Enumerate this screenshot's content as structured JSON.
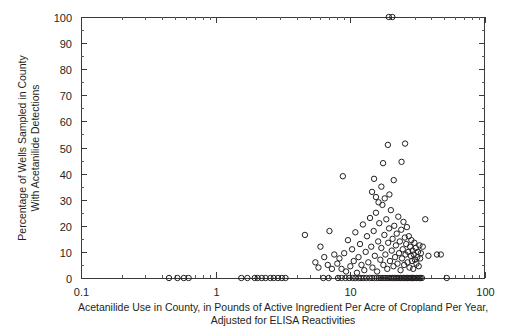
{
  "chart_data": {
    "type": "scatter",
    "title": "",
    "xlabel": "Acetanilide Use in County, in Pounds of Active Ingredient Per Acre of Cropland Per Year, Adjusted for ELISA Reactivities",
    "xlabel_line1": "Acetanilide Use in County, in Pounds of Active Ingredient Per Acre of Cropland Per Year,",
    "xlabel_line2": "Adjusted for ELISA Reactivities",
    "ylabel": "Percentage of Wells Sampled in County With Acetanilide Detections",
    "ylabel_line1": "Percentage of Wells Sampled in County",
    "ylabel_line2": "With Acetanilide Detections",
    "xscale": "log",
    "yscale": "linear",
    "xlim": [
      0.1,
      100
    ],
    "ylim": [
      0,
      100
    ],
    "grid": false,
    "legend": false,
    "marker_style": "open-circle",
    "marker_color": "#231f20",
    "xticks": [
      "0.1",
      "1",
      "10",
      "100"
    ],
    "xtick_values": [
      0.1,
      1,
      10,
      100
    ],
    "yticks": [
      "0",
      "10",
      "20",
      "30",
      "40",
      "50",
      "60",
      "70",
      "80",
      "90",
      "100"
    ],
    "ytick_values": [
      0,
      10,
      20,
      30,
      40,
      50,
      60,
      70,
      80,
      90,
      100
    ],
    "points": [
      [
        0.45,
        0
      ],
      [
        0.52,
        0
      ],
      [
        0.58,
        0
      ],
      [
        0.63,
        0
      ],
      [
        1.55,
        0
      ],
      [
        1.72,
        0
      ],
      [
        1.95,
        0
      ],
      [
        2.05,
        0
      ],
      [
        2.2,
        0
      ],
      [
        2.35,
        0
      ],
      [
        2.55,
        0
      ],
      [
        2.7,
        0
      ],
      [
        2.9,
        0
      ],
      [
        3.1,
        0
      ],
      [
        3.3,
        0
      ],
      [
        6.3,
        0
      ],
      [
        6.9,
        0
      ],
      [
        8.1,
        0
      ],
      [
        8.6,
        0
      ],
      [
        9.2,
        0
      ],
      [
        9.8,
        0
      ],
      [
        10.4,
        0
      ],
      [
        10.9,
        0
      ],
      [
        11.5,
        0
      ],
      [
        12.0,
        0
      ],
      [
        12.6,
        0
      ],
      [
        13.2,
        0
      ],
      [
        13.9,
        0
      ],
      [
        14.5,
        0
      ],
      [
        15.1,
        0
      ],
      [
        15.7,
        0
      ],
      [
        16.3,
        0
      ],
      [
        16.9,
        0
      ],
      [
        17.5,
        0
      ],
      [
        18.1,
        0
      ],
      [
        18.8,
        0
      ],
      [
        19.4,
        0
      ],
      [
        20.0,
        0
      ],
      [
        20.6,
        0
      ],
      [
        21.2,
        0
      ],
      [
        21.8,
        0
      ],
      [
        22.4,
        0
      ],
      [
        23.0,
        0
      ],
      [
        23.6,
        0
      ],
      [
        24.2,
        0
      ],
      [
        24.8,
        0
      ],
      [
        25.4,
        0
      ],
      [
        26.0,
        0
      ],
      [
        26.6,
        0
      ],
      [
        27.2,
        0
      ],
      [
        27.8,
        0
      ],
      [
        28.4,
        0
      ],
      [
        29.0,
        0
      ],
      [
        29.6,
        0
      ],
      [
        30.2,
        0
      ],
      [
        31.0,
        0
      ],
      [
        31.8,
        0
      ],
      [
        32.5,
        0
      ],
      [
        33.2,
        0
      ],
      [
        34.0,
        0
      ],
      [
        52.0,
        0
      ],
      [
        8.0,
        5.5
      ],
      [
        8.3,
        7.5
      ],
      [
        8.6,
        3.5
      ],
      [
        9.0,
        9.5
      ],
      [
        9.3,
        2.5
      ],
      [
        9.6,
        14.5
      ],
      [
        10.0,
        4.5
      ],
      [
        10.3,
        11.0
      ],
      [
        10.6,
        6.5
      ],
      [
        10.9,
        17.5
      ],
      [
        11.2,
        2.0
      ],
      [
        11.5,
        8.0
      ],
      [
        11.8,
        13.0
      ],
      [
        12.1,
        5.0
      ],
      [
        12.4,
        20.5
      ],
      [
        12.7,
        3.0
      ],
      [
        13.0,
        10.0
      ],
      [
        13.3,
        16.0
      ],
      [
        13.6,
        6.0
      ],
      [
        14.0,
        23.0
      ],
      [
        14.3,
        12.0
      ],
      [
        14.6,
        4.0
      ],
      [
        14.9,
        18.0
      ],
      [
        15.2,
        8.5
      ],
      [
        15.5,
        25.0
      ],
      [
        15.8,
        2.5
      ],
      [
        16.1,
        14.0
      ],
      [
        16.4,
        21.0
      ],
      [
        16.7,
        7.0
      ],
      [
        17.0,
        11.5
      ],
      [
        17.3,
        28.0
      ],
      [
        17.6,
        5.0
      ],
      [
        17.9,
        16.5
      ],
      [
        18.2,
        9.0
      ],
      [
        18.5,
        22.5
      ],
      [
        18.8,
        3.5
      ],
      [
        19.1,
        13.5
      ],
      [
        19.4,
        19.0
      ],
      [
        19.7,
        6.5
      ],
      [
        20.0,
        26.0
      ],
      [
        20.3,
        10.5
      ],
      [
        20.6,
        15.0
      ],
      [
        20.9,
        4.5
      ],
      [
        21.2,
        20.0
      ],
      [
        21.5,
        8.0
      ],
      [
        21.8,
        12.5
      ],
      [
        22.1,
        17.0
      ],
      [
        22.4,
        5.5
      ],
      [
        22.7,
        23.5
      ],
      [
        23.0,
        9.5
      ],
      [
        23.3,
        14.0
      ],
      [
        23.6,
        3.0
      ],
      [
        23.9,
        18.5
      ],
      [
        24.2,
        7.5
      ],
      [
        24.5,
        11.0
      ],
      [
        24.8,
        21.5
      ],
      [
        25.1,
        5.0
      ],
      [
        25.4,
        15.5
      ],
      [
        25.7,
        9.0
      ],
      [
        26.0,
        13.0
      ],
      [
        26.3,
        19.5
      ],
      [
        26.6,
        6.0
      ],
      [
        26.9,
        10.0
      ],
      [
        27.2,
        16.0
      ],
      [
        27.5,
        4.0
      ],
      [
        27.8,
        12.0
      ],
      [
        28.1,
        8.5
      ],
      [
        28.4,
        14.5
      ],
      [
        28.7,
        6.5
      ],
      [
        29.0,
        10.5
      ],
      [
        29.3,
        3.5
      ],
      [
        29.6,
        9.0
      ],
      [
        29.9,
        13.5
      ],
      [
        30.2,
        7.0
      ],
      [
        30.6,
        11.5
      ],
      [
        31.0,
        5.5
      ],
      [
        31.4,
        8.0
      ],
      [
        31.8,
        10.0
      ],
      [
        32.2,
        4.5
      ],
      [
        32.6,
        12.5
      ],
      [
        33.0,
        7.5
      ],
      [
        33.4,
        9.5
      ],
      [
        15.5,
        31.0
      ],
      [
        16.2,
        29.0
      ],
      [
        18.0,
        30.5
      ],
      [
        14.5,
        33.0
      ],
      [
        19.5,
        32.0
      ],
      [
        17.0,
        35.0
      ],
      [
        15.0,
        38.0
      ],
      [
        21.0,
        37.5
      ],
      [
        17.5,
        44.0
      ],
      [
        24.0,
        44.5
      ],
      [
        19.0,
        51.0
      ],
      [
        25.5,
        51.5
      ],
      [
        6.0,
        12.0
      ],
      [
        6.4,
        8.0
      ],
      [
        6.8,
        5.0
      ],
      [
        7.0,
        18.0
      ],
      [
        7.3,
        3.5
      ],
      [
        7.6,
        9.0
      ],
      [
        5.5,
        6.0
      ],
      [
        5.8,
        4.0
      ],
      [
        4.6,
        16.5
      ],
      [
        38.0,
        8.5
      ],
      [
        44.0,
        9.0
      ],
      [
        47.0,
        9.0
      ],
      [
        34.5,
        12.0
      ],
      [
        36.0,
        22.5
      ],
      [
        8.8,
        39.0
      ],
      [
        19.3,
        100.0
      ],
      [
        20.5,
        100.0
      ]
    ]
  }
}
